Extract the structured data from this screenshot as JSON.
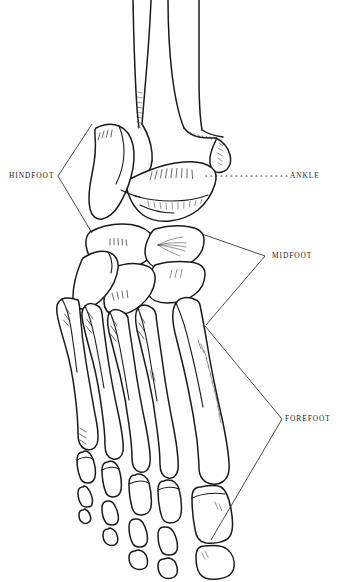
{
  "figure": {
    "width": 340,
    "height": 582,
    "background_color": "#ffffff",
    "line_color": "#1a1a1a",
    "style": "black and white pen line drawing"
  },
  "labels": [
    {
      "id": "hindfoot",
      "text": "HINDFOOT",
      "side": "left",
      "leader_type": "bracket",
      "bracket_apex": [
        58,
        176
      ],
      "bracket_ends": [
        [
          92,
          124
        ],
        [
          92,
          233
        ]
      ]
    },
    {
      "id": "ankle",
      "text": "ANKLE",
      "side": "right",
      "leader_type": "dotted-line",
      "leader_start": [
        206,
        176
      ],
      "leader_end": [
        288,
        176
      ]
    },
    {
      "id": "midfoot",
      "text": "MIDFOOT",
      "side": "right",
      "leader_type": "bracket",
      "bracket_apex": [
        265,
        256
      ],
      "bracket_ends": [
        [
          202,
          234
        ],
        [
          206,
          325
        ]
      ]
    },
    {
      "id": "forefoot",
      "text": "FOREFOOT",
      "side": "right",
      "leader_type": "bracket",
      "bracket_apex": [
        282,
        419
      ],
      "bracket_ends": [
        [
          205,
          326
        ],
        [
          211,
          540
        ]
      ]
    }
  ],
  "bones": {
    "leg": [
      "fibula",
      "tibia"
    ],
    "hindfoot": [
      "talus",
      "calcaneus"
    ],
    "midfoot": [
      "navicular",
      "cuboid",
      "medial-cuneiform",
      "intermediate-cuneiform",
      "lateral-cuneiform"
    ],
    "forefoot": [
      "metatarsal-1",
      "metatarsal-2",
      "metatarsal-3",
      "metatarsal-4",
      "metatarsal-5",
      "proximal-phalanges",
      "middle-phalanges",
      "distal-phalanges"
    ]
  }
}
